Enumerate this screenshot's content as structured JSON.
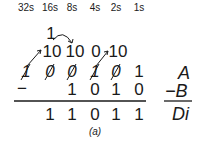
{
  "headers": [
    "32s",
    "16s",
    "8s",
    "4s",
    "2s",
    "1s"
  ],
  "borrow_top": "1",
  "borrow_row": [
    "10",
    "10",
    "0",
    "10"
  ],
  "row_a": [
    "1",
    "0",
    "0",
    "1",
    "0",
    "1"
  ],
  "row_a_struck": [
    true,
    true,
    true,
    true,
    true,
    false
  ],
  "minus_sign": "−",
  "row_b": [
    "1",
    "0",
    "1",
    "0"
  ],
  "row_result": [
    "1",
    "1",
    "0",
    "1",
    "1"
  ],
  "labels": {
    "a": "A",
    "b": "−B",
    "di": "Di"
  },
  "caption": "(a)"
}
